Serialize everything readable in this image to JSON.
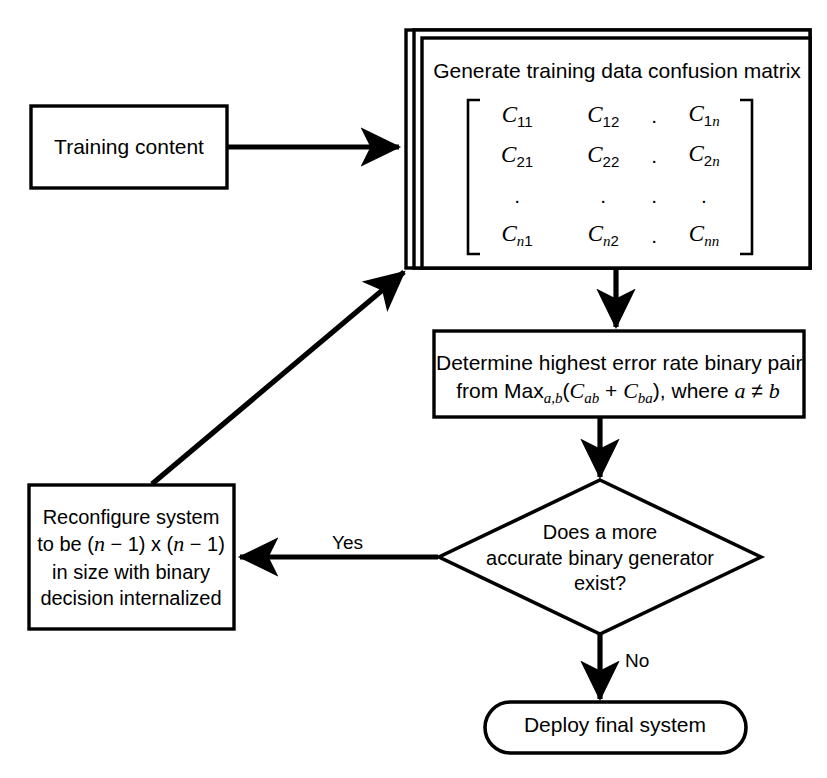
{
  "diagram": {
    "type": "flowchart",
    "background_color": "#ffffff",
    "line_color": "#000000"
  },
  "nodes": {
    "training_content": {
      "shape": "rectangle",
      "label": "Training content"
    },
    "generate_matrix": {
      "shape": "stacked-rectangle",
      "title": "Generate training data confusion matrix",
      "matrix": {
        "bracket_open": "[",
        "bracket_close": "]",
        "rows": [
          [
            "C11",
            "C12",
            ".",
            "C1n"
          ],
          [
            "C21",
            "C22",
            ".",
            "C2n"
          ],
          [
            ".",
            ".",
            ".",
            "."
          ],
          [
            "Cn1",
            "Cn2",
            ".",
            "Cnn"
          ]
        ]
      }
    },
    "determine_pair": {
      "shape": "rectangle",
      "line1": "Determine highest error rate binary pair",
      "line2_prefix": "from Max",
      "line2_max_sub": "a,b",
      "line2_open": "(",
      "line2_c1": "C",
      "line2_c1_sub": "ab",
      "line2_plus": " + ",
      "line2_c2": "C",
      "line2_c2_sub": "ba",
      "line2_close": "), where ",
      "line2_a": "a",
      "line2_neq": " ≠ ",
      "line2_b": "b"
    },
    "decision": {
      "shape": "diamond",
      "line1": "Does a more",
      "line2": "accurate binary generator",
      "line3": "exist?"
    },
    "reconfigure": {
      "shape": "rectangle",
      "line1": "Reconfigure system",
      "line2_prefix": "to be (",
      "line2_n1": "n",
      "line2_mid": " − 1) x (",
      "line2_n2": "n",
      "line2_suffix": " − 1)",
      "line3": "in size with binary",
      "line4": "decision internalized"
    },
    "deploy": {
      "shape": "rounded-terminal",
      "label": "Deploy final system"
    }
  },
  "edges": [
    {
      "id": "training-to-generate",
      "from": "training_content",
      "to": "generate_matrix",
      "label": "",
      "arrow": "end"
    },
    {
      "id": "generate-to-determine",
      "from": "generate_matrix",
      "to": "determine_pair",
      "label": "",
      "arrow": "end"
    },
    {
      "id": "determine-to-decision",
      "from": "determine_pair",
      "to": "decision",
      "label": "",
      "arrow": "end"
    },
    {
      "id": "decision-to-reconfigure",
      "from": "decision",
      "to": "reconfigure",
      "label": "Yes",
      "arrow": "end"
    },
    {
      "id": "decision-to-deploy",
      "from": "decision",
      "to": "deploy",
      "label": "No",
      "arrow": "end"
    },
    {
      "id": "reconfigure-to-generate",
      "from": "reconfigure",
      "to": "generate_matrix",
      "label": "",
      "arrow": "end"
    }
  ],
  "edge_labels": {
    "yes": "Yes",
    "no": "No"
  }
}
